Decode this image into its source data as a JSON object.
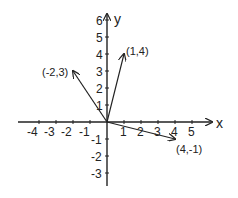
{
  "diagram": {
    "colors": {
      "ink": "#222222",
      "background": "#ffffff"
    },
    "axes": {
      "x_label": "x",
      "y_label": "y",
      "x_ticks": [
        "-4",
        "-3",
        "-2",
        "-1",
        "1",
        "2",
        "3",
        "4",
        "5"
      ],
      "y_ticks": [
        "6",
        "5",
        "4",
        "3",
        "2",
        "1",
        "-1",
        "-2",
        "-3"
      ],
      "x_range": [
        -5,
        6
      ],
      "y_range": [
        -4,
        6.5
      ]
    },
    "vectors": [
      {
        "label": "(1,4)",
        "x": 1,
        "y": 4
      },
      {
        "label": "(-2,3)",
        "x": -2,
        "y": 3
      },
      {
        "label": "(4,-1)",
        "x": 4,
        "y": -1
      }
    ]
  }
}
